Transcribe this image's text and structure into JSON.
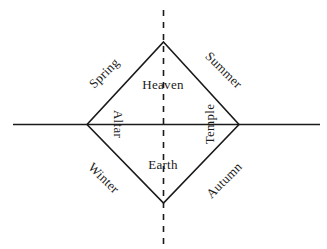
{
  "diagram": {
    "background_color": "#ffffff",
    "stroke_color": "#1a1a1a",
    "axes": {
      "horizontal": {
        "style": "solid",
        "x1": 13,
        "y1": 124,
        "x2": 320,
        "y2": 124
      },
      "vertical": {
        "style": "dashed",
        "dash_pattern": "6 6",
        "x1": 163,
        "y1": 10,
        "x2": 163,
        "y2": 245
      }
    },
    "rhombus": {
      "top": {
        "x": 163,
        "y": 42
      },
      "right": {
        "x": 239,
        "y": 124
      },
      "bottom": {
        "x": 163,
        "y": 203
      },
      "left": {
        "x": 87,
        "y": 124
      }
    },
    "inner_labels": [
      {
        "key": "heaven",
        "text": "Heaven",
        "rotation": 0,
        "position": "top-center-inside"
      },
      {
        "key": "earth",
        "text": "Earth",
        "rotation": 0,
        "position": "bottom-center-inside"
      },
      {
        "key": "altar",
        "text": "Altar",
        "rotation": 90,
        "position": "left-center-inside"
      },
      {
        "key": "temple",
        "text": "Temple",
        "rotation": -90,
        "position": "right-center-inside"
      }
    ],
    "season_labels": [
      {
        "key": "spring",
        "text": "Spring",
        "rotation": -45,
        "quadrant": "upper-left"
      },
      {
        "key": "summer",
        "text": "Summer",
        "rotation": 45,
        "quadrant": "upper-right"
      },
      {
        "key": "winter",
        "text": "Winter",
        "rotation": 45,
        "quadrant": "lower-left"
      },
      {
        "key": "autumn",
        "text": "Autumn",
        "rotation": -45,
        "quadrant": "lower-right"
      }
    ]
  }
}
